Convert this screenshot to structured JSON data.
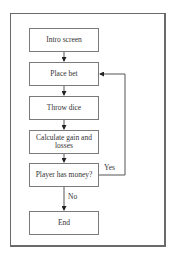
{
  "diagram": {
    "type": "flowchart",
    "nodes": [
      {
        "id": "intro",
        "label": "Intro screen"
      },
      {
        "id": "bet",
        "label": "Place bet"
      },
      {
        "id": "dice",
        "label": "Throw dice"
      },
      {
        "id": "calc",
        "label": "Calculate gain and losses"
      },
      {
        "id": "check",
        "label": "Player has money?"
      },
      {
        "id": "end",
        "label": "End"
      }
    ],
    "edges": [
      {
        "from": "intro",
        "to": "bet",
        "label": ""
      },
      {
        "from": "bet",
        "to": "dice",
        "label": ""
      },
      {
        "from": "dice",
        "to": "calc",
        "label": ""
      },
      {
        "from": "calc",
        "to": "check",
        "label": ""
      },
      {
        "from": "check",
        "to": "bet",
        "label": "Yes"
      },
      {
        "from": "check",
        "to": "end",
        "label": "No"
      }
    ],
    "edge_labels": {
      "yes": "Yes",
      "no": "No"
    }
  }
}
